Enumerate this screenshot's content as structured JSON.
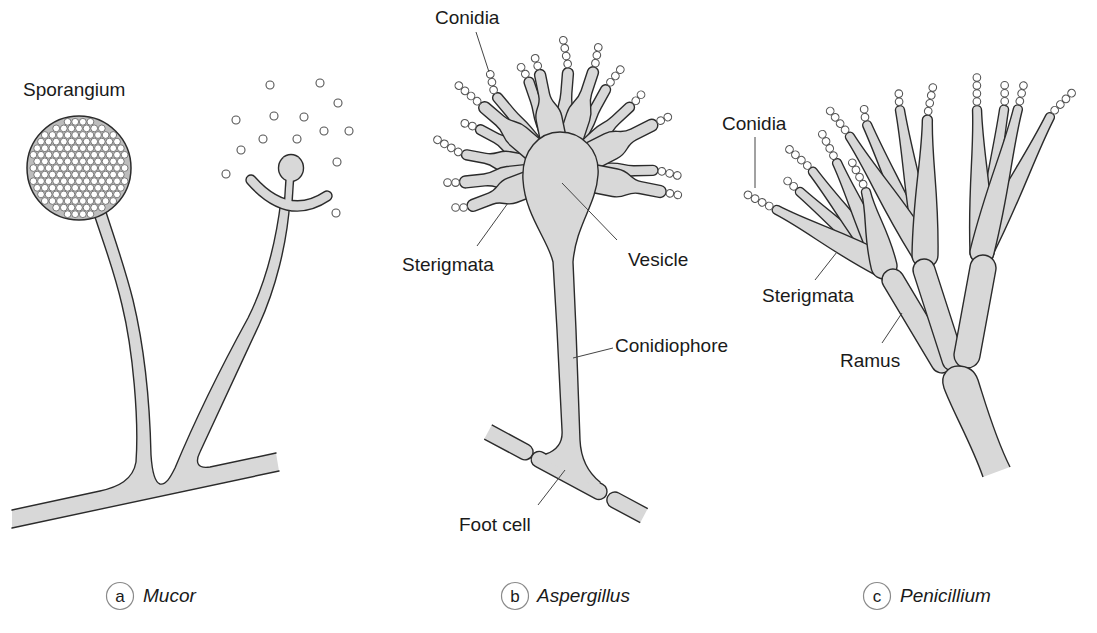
{
  "figure": {
    "panels": {
      "mucor": {
        "letter": "a",
        "name": "Mucor",
        "labels": {
          "sporangium": "Sporangium"
        }
      },
      "aspergillus": {
        "letter": "b",
        "name": "Aspergillus",
        "labels": {
          "conidia": "Conidia",
          "sterigmata": "Sterigmata",
          "vesicle": "Vesicle",
          "conidiophore": "Conidiophore",
          "foot_cell": "Foot cell"
        }
      },
      "penicillium": {
        "letter": "c",
        "name": "Penicillium",
        "labels": {
          "conidia": "Conidia",
          "sterigmata": "Sterigmata",
          "ramus": "Ramus"
        }
      }
    }
  },
  "colors": {
    "structure_fill": "#d8d8d8",
    "outline": "#2b2b2b",
    "spore_fill": "#ffffff",
    "text": "#1a1a1a",
    "caption_ring": "#8a8a8a"
  }
}
